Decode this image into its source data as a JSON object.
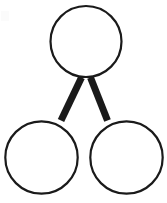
{
  "document": {
    "title": "Three-node graph diagram",
    "kind": "line-drawing",
    "background_color": "#ffffff",
    "width": 167,
    "height": 203
  },
  "diagram": {
    "type": "graph",
    "node_count": 3,
    "edge_count": 2,
    "stroke_color": "#1a1a1a",
    "fill_color": "#ffffff",
    "node_stroke_width": 2.2,
    "edge_stroke_width": 7,
    "nodes": [
      {
        "id": "top",
        "label": "",
        "role": "parent",
        "cx": 86,
        "cy": 41.5,
        "r": 35.5
      },
      {
        "id": "bottom-left",
        "label": "",
        "role": "child",
        "cx": 41.5,
        "cy": 157.5,
        "r": 36.2
      },
      {
        "id": "bottom-right",
        "label": "",
        "role": "child",
        "cx": 126.5,
        "cy": 157.5,
        "r": 36.2
      }
    ],
    "edges": [
      {
        "id": "edge-top-to-bottom-left",
        "from": "top",
        "to": "bottom-left",
        "x1": 81.5,
        "y1": 77.5,
        "x2": 61,
        "y2": 120.5
      },
      {
        "id": "edge-top-to-bottom-right",
        "from": "top",
        "to": "bottom-right",
        "x1": 90.5,
        "y1": 77.5,
        "x2": 107.5,
        "y2": 120.5
      }
    ],
    "artifact": {
      "present": true,
      "description": "faint light-gray scan speck near top-left corner",
      "color": "#fbfbfb"
    }
  }
}
